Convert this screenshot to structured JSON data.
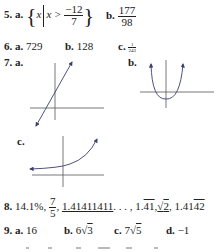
{
  "problems": {
    "p5": {
      "number": "5.",
      "a_label": "a.",
      "a_set_var": "x",
      "a_condition_lhs": "x >",
      "a_frac_num": "−12",
      "a_frac_den": "7",
      "b_label": "b.",
      "b_frac_num": "177",
      "b_frac_den": "98"
    },
    "p6": {
      "number": "6.",
      "a_label": "a.",
      "a_value": "729",
      "b_label": "b.",
      "b_value": "128",
      "c_label": "c.",
      "c_frac_num": "1",
      "c_frac_den": "243"
    },
    "p7": {
      "number": "7.",
      "a_label": "a.",
      "b_label": "b.",
      "c_label": "c.",
      "graphs": {
        "a": "increasing straight line with arrows at both ends",
        "b": "upward-opening parabola with arrows",
        "c": "exponential growth curve with arrows"
      },
      "curve_color": "#3a3f6e"
    },
    "p8": {
      "number": "8.",
      "item1": "14.1%,",
      "frac_num": "7",
      "frac_den": "5",
      "comma1": ",",
      "item3": "1.41411411",
      "ellipsis": ". . . ,",
      "item4_pre": "1.",
      "item4_bar": "41",
      "comma2": ",",
      "item5_rad": "2",
      "comma3": ",",
      "item6_pre": "1.41",
      "item6_bar": "42"
    },
    "p9": {
      "number": "9.",
      "a_label": "a.",
      "a_value": "16",
      "b_label": "b.",
      "b_coef": "6",
      "b_rad": "3",
      "c_label": "c.",
      "c_coef": "7",
      "c_rad": "5",
      "d_label": "d.",
      "d_value": "−1"
    }
  }
}
